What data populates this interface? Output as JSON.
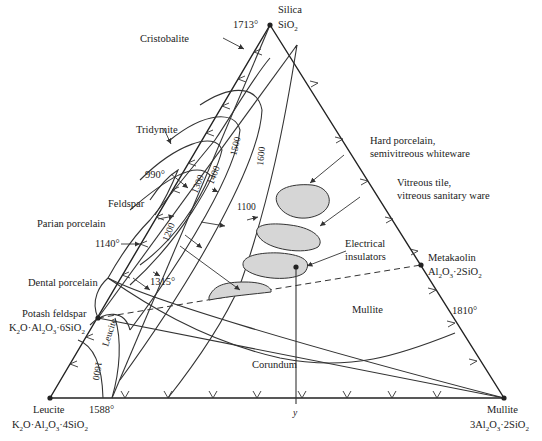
{
  "diagram": {
    "type": "ternary-phase-diagram",
    "vertices": {
      "top": {
        "name": "Silica",
        "formula": "SiO2",
        "temp": "1713°"
      },
      "bottom_left": {
        "name": "Leucite",
        "formula": "K2O·Al2O3·4SiO2"
      },
      "bottom_right": {
        "name": "Mullite",
        "formula": "3Al2O3·2SiO2"
      }
    },
    "compounds": {
      "potash_feldspar": {
        "name": "Potash feldspar",
        "formula": "K2O·Al2O3·6SiO2"
      },
      "metakaolin": {
        "name": "Metakaolin",
        "formula": "Al2O3·2SiO2"
      }
    },
    "phase_fields": {
      "cristobalite": "Cristobalite",
      "tridymite": "Tridymite",
      "feldspar": "Feldspar",
      "leucite": "Leucite",
      "mullite": "Mullite",
      "corundum": "Corundum"
    },
    "temperatures": {
      "t990": "990°",
      "t1140": "1140°",
      "t1315": "1315°",
      "t1588": "1588°",
      "t1810": "1810°"
    },
    "isotherms": {
      "i1100": "1100",
      "i1200": "1200",
      "i1300": "1300",
      "i1400": "1400",
      "i1500": "1500",
      "i1600a": "1600",
      "i1600b": "1600"
    },
    "product_regions": {
      "hard_porcelain": {
        "line1": "Hard porcelain,",
        "line2": "semivitreous whiteware"
      },
      "vitreous_tile": {
        "line1": "Vitreous tile,",
        "line2": "vitreous sanitary ware"
      },
      "electrical": {
        "line1": "Electrical",
        "line2": "insulators"
      },
      "parian": "Parian porcelain",
      "dental": "Dental porcelain"
    },
    "composition_marker": "y"
  }
}
